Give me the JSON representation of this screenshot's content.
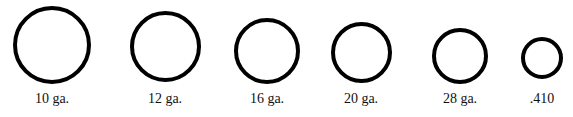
{
  "style": {
    "ring_color": "#000000",
    "ring_stroke_px": 4,
    "label_color": "#111111"
  },
  "gauges": [
    {
      "label": "10 ga.",
      "cx": 52,
      "cy": 45,
      "diameter": 78
    },
    {
      "label": "12 ga.",
      "cx": 165,
      "cy": 46,
      "diameter": 71
    },
    {
      "label": "16 ga.",
      "cx": 267,
      "cy": 51,
      "diameter": 66
    },
    {
      "label": "20 ga.",
      "cx": 361,
      "cy": 52,
      "diameter": 61
    },
    {
      "label": "28 ga.",
      "cx": 460,
      "cy": 56,
      "diameter": 56
    },
    {
      "label": ".410",
      "cx": 542,
      "cy": 58,
      "diameter": 42
    }
  ]
}
